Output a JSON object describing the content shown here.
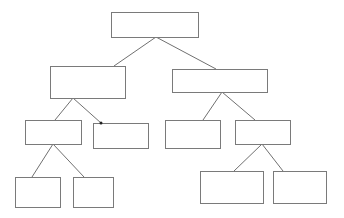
{
  "diagram": {
    "type": "tree",
    "title": "",
    "nodes": [
      {
        "id": "root",
        "label": "",
        "parent": null
      },
      {
        "id": "l1-left",
        "label": "",
        "parent": "root"
      },
      {
        "id": "l1-right",
        "label": "",
        "parent": "root"
      },
      {
        "id": "l2-left-a",
        "label": "",
        "parent": "l1-left"
      },
      {
        "id": "l2-left-b",
        "label": "",
        "parent": "l1-left"
      },
      {
        "id": "l2-right-a",
        "label": "",
        "parent": "l1-right"
      },
      {
        "id": "l2-right-b",
        "label": "",
        "parent": "l1-right"
      },
      {
        "id": "l3-left-a",
        "label": "",
        "parent": "l2-left-a"
      },
      {
        "id": "l3-left-b",
        "label": "",
        "parent": "l2-left-a"
      },
      {
        "id": "l3-right-a",
        "label": "",
        "parent": "l2-right-b"
      },
      {
        "id": "l3-right-b",
        "label": "",
        "parent": "l2-right-b"
      }
    ],
    "colors": {
      "box_stroke": "#7a7a7a",
      "edge": "#707070",
      "background": "#ffffff"
    }
  }
}
